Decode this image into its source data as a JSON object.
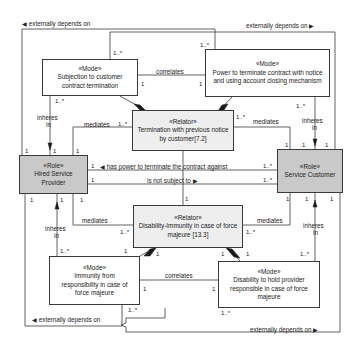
{
  "diagram": {
    "type": "OntoUML class diagram",
    "nodes": {
      "mode_subjection": {
        "stereotype": "«Mode»",
        "name": "Subjection to customer contract termination"
      },
      "mode_power": {
        "stereotype": "«Mode»",
        "name": "Power to terminate contract with notice and using account closing mechanism"
      },
      "relator_termination": {
        "stereotype": "«Relator»",
        "name": "Termination with previous notice by customer[7.2]"
      },
      "role_provider": {
        "stereotype": "«Role»",
        "name": "Hired Service Provider"
      },
      "role_customer": {
        "stereotype": "«Role»",
        "name": "Service Customer"
      },
      "relator_disability": {
        "stereotype": "«Relator»",
        "name": "Disability-Immunity in case of force majeure [13.3]"
      },
      "mode_immunity": {
        "stereotype": "«Mode»",
        "name": "Immunity from responsibility in case of force majeure"
      },
      "mode_disability": {
        "stereotype": "«Mode»",
        "name": "Disability to hold provider responsible in case of force majeure"
      }
    },
    "edge_labels": {
      "ext_top_left": "externally depends on",
      "ext_top_right": "externally depends on",
      "ext_bottom_left": "externally depends on",
      "ext_bottom_right": "externally depends on",
      "correlates_top": "correlates",
      "correlates_bottom": "correlates",
      "mediates_tl": "mediates",
      "mediates_tr": "mediates",
      "mediates_bl": "mediates",
      "mediates_br": "mediates",
      "inheres_tl": "inheres",
      "in_tl": "in",
      "inheres_tr": "inheres",
      "in_tr": "in",
      "inheres_bl": "inheres",
      "in_bl": "in",
      "inheres_br": "inheres",
      "in_br": "in",
      "has_power": "has power to terminate the contract against",
      "not_subject": "is not subject to"
    },
    "multiplicities": {
      "one": "1",
      "many": "1..*"
    },
    "arrows": {
      "left": "◀",
      "right": "▶"
    }
  }
}
